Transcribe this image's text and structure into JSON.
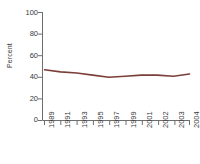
{
  "chart_data": {
    "type": "line",
    "title": "",
    "xlabel": "",
    "ylabel": "Percent",
    "ylim": [
      0,
      100
    ],
    "yticks": [
      0,
      20,
      40,
      60,
      80,
      100
    ],
    "ytick_labels": [
      "0",
      "20",
      "40",
      "60",
      "80",
      "100"
    ],
    "categories": [
      "1989",
      "1991",
      "1993",
      "1995",
      "1997",
      "1999",
      "2001",
      "2002",
      "2003",
      "2004"
    ],
    "x": [
      "1989",
      "1991",
      "1993",
      "1995",
      "1997",
      "1999",
      "2001",
      "2002",
      "2003",
      "2004"
    ],
    "values": [
      47,
      45,
      44,
      42,
      40,
      41,
      42,
      42,
      41,
      43
    ],
    "series": [
      {
        "name": "Percent",
        "color": "#7B3F3A",
        "values": [
          47,
          45,
          44,
          42,
          40,
          41,
          42,
          42,
          41,
          43
        ]
      }
    ],
    "grid": false,
    "legend": "none",
    "line_color": "#7B3F3A",
    "axis_color": "#6e6e6e",
    "text_color": "#3a3a3a"
  }
}
